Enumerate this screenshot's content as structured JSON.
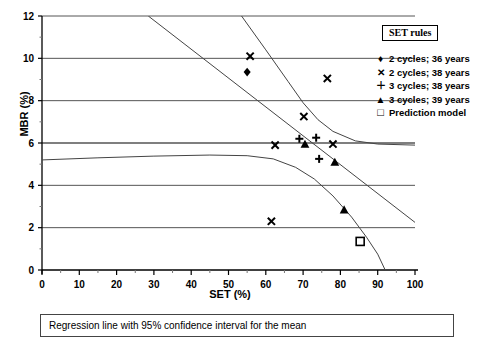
{
  "chart_data": {
    "type": "scatter",
    "title": "",
    "xlabel": "SET (%)",
    "ylabel": "MBR (%)",
    "xlim": [
      0,
      100
    ],
    "ylim": [
      0,
      12
    ],
    "xticks": [
      0,
      10,
      20,
      30,
      40,
      50,
      60,
      70,
      80,
      90,
      100
    ],
    "yticks": [
      0,
      2,
      4,
      6,
      8,
      10,
      12
    ],
    "xtick_labels": [
      "0",
      "10",
      "20",
      "30",
      "40",
      "50",
      "60",
      "70",
      "80",
      "90",
      "100"
    ],
    "ytick_labels": [
      "0",
      "2",
      "4",
      "6",
      "8",
      "10",
      "12"
    ],
    "grid": "horizontal",
    "legend_position": "top-right",
    "legend_title": "SET rules",
    "series": [
      {
        "name": "2 cycles; 36 years",
        "marker": "diamond",
        "points": [
          [
            55.0,
            9.35
          ]
        ]
      },
      {
        "name": "2 cycles; 38 years",
        "marker": "x",
        "points": [
          [
            55.8,
            10.1
          ],
          [
            61.5,
            2.3
          ],
          [
            62.5,
            5.9
          ],
          [
            70.2,
            7.25
          ],
          [
            76.5,
            9.05
          ],
          [
            78.0,
            5.95
          ]
        ]
      },
      {
        "name": "3 cycles; 38 years",
        "marker": "plus",
        "points": [
          [
            69.0,
            6.2
          ],
          [
            73.5,
            6.25
          ],
          [
            74.3,
            5.25
          ]
        ]
      },
      {
        "name": "3 cycles; 39 years",
        "marker": "triangle",
        "points": [
          [
            70.5,
            5.95
          ],
          [
            78.5,
            5.1
          ],
          [
            81.0,
            2.85
          ]
        ]
      },
      {
        "name": "Prediction model",
        "marker": "square-open",
        "points": [
          [
            85.3,
            1.35
          ]
        ]
      }
    ],
    "lines": [
      {
        "name": "regression-line",
        "style": "solid",
        "points": [
          [
            28.5,
            12.0
          ],
          [
            100.0,
            2.25
          ]
        ]
      },
      {
        "name": "upper-confidence-limit",
        "style": "solid",
        "points": [
          [
            53.5,
            12.0
          ],
          [
            60.0,
            10.4
          ],
          [
            66.0,
            8.9
          ],
          [
            70.0,
            7.9
          ],
          [
            74.0,
            7.1
          ],
          [
            78.0,
            6.55
          ],
          [
            84.0,
            6.1
          ],
          [
            90.0,
            5.95
          ],
          [
            100.0,
            5.9
          ]
        ]
      },
      {
        "name": "lower-confidence-limit",
        "style": "solid",
        "points": [
          [
            0.0,
            5.2
          ],
          [
            15.0,
            5.3
          ],
          [
            30.0,
            5.38
          ],
          [
            45.0,
            5.43
          ],
          [
            55.0,
            5.4
          ],
          [
            62.0,
            5.25
          ],
          [
            68.0,
            4.85
          ],
          [
            73.0,
            4.3
          ],
          [
            78.0,
            3.5
          ],
          [
            83.0,
            2.5
          ],
          [
            87.0,
            1.55
          ],
          [
            90.0,
            0.75
          ],
          [
            92.0,
            0.0
          ]
        ]
      }
    ],
    "caption": "Regression line with 95% confidence interval for the mean"
  },
  "legend": {
    "title": "SET rules",
    "items": [
      {
        "marker": "♦",
        "label": "2 cycles; 36 years"
      },
      {
        "marker": "✕",
        "label": "2 cycles; 38 years"
      },
      {
        "marker": "＋",
        "label": "3 cycles; 38 years"
      },
      {
        "marker": "▲",
        "label": "3 cycles; 39 years"
      },
      {
        "marker": "□",
        "label": "Prediction model"
      }
    ]
  },
  "axes": {
    "x_title": "SET (%)",
    "y_title": "MBR (%)"
  },
  "caption": {
    "text": "Regression line with 95% confidence interval for the mean"
  },
  "colors": {
    "axis": "#000000",
    "grid": "#555555",
    "marker": "#000000",
    "line": "#444444",
    "caption_border": "#444444"
  }
}
